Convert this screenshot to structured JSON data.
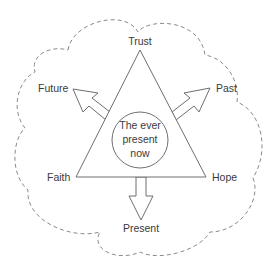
{
  "diagram": {
    "labels": {
      "top": "Trust",
      "upper_left": "Future",
      "upper_right": "Past",
      "lower_left": "Faith",
      "lower_right": "Hope",
      "bottom": "Present"
    },
    "center": {
      "line1": "The ever",
      "line2": "present",
      "line3": "now"
    },
    "colors": {
      "stroke": "#6e6e6e",
      "cloud_stroke": "#8a8a8a",
      "text": "#3a3a3a",
      "background": "#ffffff"
    }
  }
}
